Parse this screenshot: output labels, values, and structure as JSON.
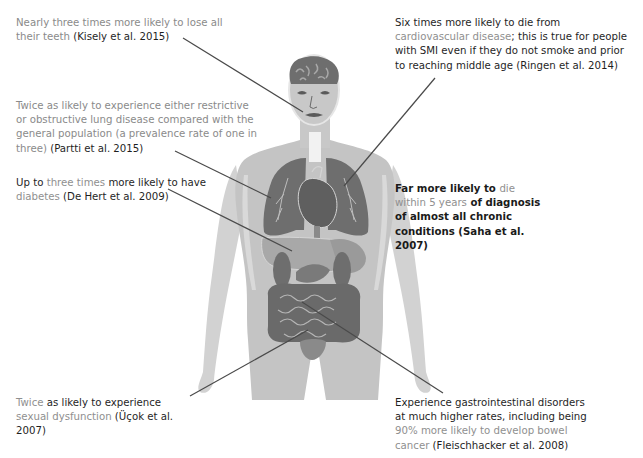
{
  "figure": {
    "colors": {
      "body": "#c8c8c8",
      "body_light": "#d9d9d9",
      "organ_dark": "#6e6e6e",
      "organ_mid": "#9a9a9a",
      "organ_light": "#b4b4b4",
      "line": "#4a4a4a",
      "text_primary": "#2a2a2a",
      "text_accent": "#8f8f8f"
    }
  },
  "callouts": {
    "teeth": {
      "part1": "Nearly three times more likely to lose all their teeth ",
      "cite": "(Kisely et al. 2015)"
    },
    "cardio": {
      "part1": "Six times more likely to die from ",
      "accent": "cardiovascular disease",
      "part2": "; this is true for people with SMI even if they do not smoke and prior to reaching middle age ",
      "cite": "(Ringen et al. 2014)"
    },
    "lung": {
      "part1": "Twice as likely to experience either restrictive or obstructive lung disease compared with the general population (a prevalence rate of one in three) ",
      "cite": "(Partti et al. 2015)"
    },
    "diabetes": {
      "part1": "Up to ",
      "accent1": "three times",
      "part2": " more likely to have ",
      "accent2": "diabetes",
      "cite": " (De Hert et al. 2009)"
    },
    "chronic": {
      "part1": "Far more likely to ",
      "accent": " die within 5 years",
      "part2": " of diagnosis of almost all chronic conditions ",
      "cite": "(Saha et al. 2007)"
    },
    "sexual": {
      "accent1": "Twice",
      "part1": " as likely to experience ",
      "accent2": "sexual dysfunction",
      "cite": " (Üçok et al. 2007)"
    },
    "gi": {
      "part1": "Experience gastrointestinal disorders at much higher rates, including being ",
      "accent": " 90% more likely to develop bowel cancer",
      "cite": " (Fleischhacker et al. 2008)"
    }
  }
}
